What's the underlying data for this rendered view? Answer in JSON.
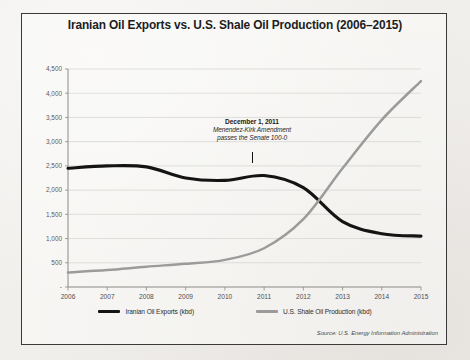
{
  "chart_data": {
    "type": "line",
    "title": "Iranian Oil Exports vs. U.S. Shale Oil Production (2006–2015)",
    "xlabel": "",
    "ylabel": "",
    "x": [
      2006,
      2007,
      2008,
      2009,
      2010,
      2011,
      2012,
      2013,
      2014,
      2015
    ],
    "xtick_labels": [
      "2006",
      "2007",
      "2008",
      "2009",
      "2010",
      "2011",
      "2012",
      "2013",
      "2014",
      "2015"
    ],
    "ytick_labels": [
      "-",
      "500",
      "1,000",
      "1,500",
      "2,000",
      "2,500",
      "3,000",
      "3,500",
      "4,000",
      "4,500"
    ],
    "ytick_values": [
      0,
      500,
      1000,
      1500,
      2000,
      2500,
      3000,
      3500,
      4000,
      4500
    ],
    "ylim": [
      0,
      4500
    ],
    "xlim": [
      2006,
      2015
    ],
    "grid": true,
    "legend_position": "bottom",
    "series": [
      {
        "name": "Iranian Oil Exports (kbd)",
        "color": "#141414",
        "values": [
          2450,
          2500,
          2480,
          2250,
          2200,
          2300,
          2050,
          1350,
          1100,
          1050
        ]
      },
      {
        "name": "U.S. Shale Oil Production (kbd)",
        "color": "#9b9b9b",
        "values": [
          300,
          350,
          420,
          480,
          560,
          800,
          1400,
          2450,
          3450,
          4250
        ]
      }
    ],
    "annotations": [
      {
        "x": 2011.4,
        "y": 2300,
        "date": "December 1, 2011",
        "line1": "Menendez-Kirk Amendment",
        "line2": "passes the Senate 100-0"
      }
    ],
    "source": "Source: U.S. Energy Information Administration",
    "source_label": "Source:",
    "source_text": "U.S. Energy Information Administration"
  },
  "colors": {
    "background": "#f1efec",
    "frame_border": "#3a3a3a",
    "gridline": "#cfcdc9",
    "iran_line": "#141414",
    "shale_line": "#9b9b9b",
    "title_text": "#1d1d1d"
  }
}
